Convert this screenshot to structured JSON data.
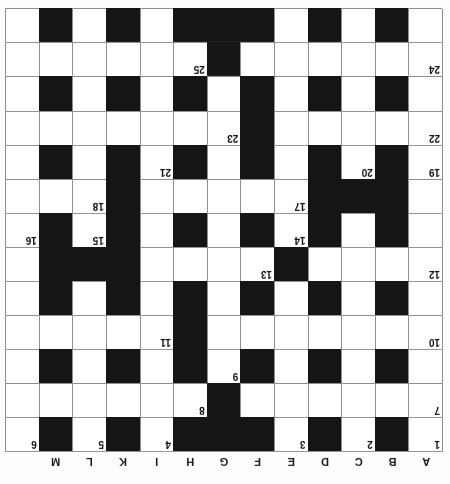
{
  "puzzle": {
    "title": "Crossword Grid",
    "orientation": "upside-down",
    "columns": 13,
    "rows": 13,
    "column_labels": [
      "A",
      "B",
      "C",
      "D",
      "E",
      "F",
      "G",
      "H",
      "I",
      "K",
      "L",
      "M"
    ],
    "numbers_present": [
      1,
      2,
      3,
      4,
      5,
      6,
      7,
      8,
      9,
      10,
      11,
      12,
      13,
      14,
      15,
      16,
      17,
      18,
      19,
      20,
      21,
      22,
      23,
      24,
      25
    ],
    "colors": {
      "block": "#151515",
      "cell": "#ffffff",
      "grid_line": "#8e8e8e",
      "text": "#111111"
    },
    "grid": [
      {
        "cells": [
          {
            "block": false,
            "num": "1"
          },
          {
            "block": true,
            "num": ""
          },
          {
            "block": false,
            "num": "2"
          },
          {
            "block": true,
            "num": ""
          },
          {
            "block": false,
            "num": "3"
          },
          {
            "block": true,
            "num": ""
          },
          {
            "block": true,
            "num": ""
          },
          {
            "block": true,
            "num": ""
          },
          {
            "block": false,
            "num": "4"
          },
          {
            "block": true,
            "num": ""
          },
          {
            "block": false,
            "num": "5"
          },
          {
            "block": true,
            "num": ""
          },
          {
            "block": false,
            "num": "6"
          }
        ]
      },
      {
        "cells": [
          {
            "block": false,
            "num": "7"
          },
          {
            "block": false,
            "num": ""
          },
          {
            "block": false,
            "num": ""
          },
          {
            "block": false,
            "num": ""
          },
          {
            "block": false,
            "num": ""
          },
          {
            "block": false,
            "num": ""
          },
          {
            "block": true,
            "num": ""
          },
          {
            "block": false,
            "num": "8"
          },
          {
            "block": false,
            "num": ""
          },
          {
            "block": false,
            "num": ""
          },
          {
            "block": false,
            "num": ""
          },
          {
            "block": false,
            "num": ""
          },
          {
            "block": false,
            "num": ""
          }
        ]
      },
      {
        "cells": [
          {
            "block": false,
            "num": ""
          },
          {
            "block": true,
            "num": ""
          },
          {
            "block": false,
            "num": ""
          },
          {
            "block": true,
            "num": ""
          },
          {
            "block": false,
            "num": ""
          },
          {
            "block": true,
            "num": ""
          },
          {
            "block": false,
            "num": "9"
          },
          {
            "block": true,
            "num": ""
          },
          {
            "block": false,
            "num": ""
          },
          {
            "block": true,
            "num": ""
          },
          {
            "block": false,
            "num": ""
          },
          {
            "block": true,
            "num": ""
          },
          {
            "block": false,
            "num": ""
          }
        ]
      },
      {
        "cells": [
          {
            "block": false,
            "num": "10"
          },
          {
            "block": false,
            "num": ""
          },
          {
            "block": false,
            "num": ""
          },
          {
            "block": false,
            "num": ""
          },
          {
            "block": false,
            "num": ""
          },
          {
            "block": false,
            "num": ""
          },
          {
            "block": false,
            "num": ""
          },
          {
            "block": true,
            "num": ""
          },
          {
            "block": false,
            "num": "11"
          },
          {
            "block": false,
            "num": ""
          },
          {
            "block": false,
            "num": ""
          },
          {
            "block": false,
            "num": ""
          },
          {
            "block": false,
            "num": ""
          }
        ]
      },
      {
        "cells": [
          {
            "block": false,
            "num": ""
          },
          {
            "block": true,
            "num": ""
          },
          {
            "block": false,
            "num": ""
          },
          {
            "block": true,
            "num": ""
          },
          {
            "block": false,
            "num": ""
          },
          {
            "block": true,
            "num": ""
          },
          {
            "block": false,
            "num": ""
          },
          {
            "block": true,
            "num": ""
          },
          {
            "block": false,
            "num": ""
          },
          {
            "block": true,
            "num": ""
          },
          {
            "block": false,
            "num": ""
          },
          {
            "block": true,
            "num": ""
          },
          {
            "block": false,
            "num": ""
          }
        ]
      },
      {
        "cells": [
          {
            "block": false,
            "num": "12"
          },
          {
            "block": false,
            "num": ""
          },
          {
            "block": false,
            "num": ""
          },
          {
            "block": false,
            "num": ""
          },
          {
            "block": true,
            "num": ""
          },
          {
            "block": false,
            "num": "13"
          },
          {
            "block": false,
            "num": ""
          },
          {
            "block": false,
            "num": ""
          },
          {
            "block": false,
            "num": ""
          },
          {
            "block": true,
            "num": ""
          },
          {
            "block": true,
            "num": ""
          },
          {
            "block": true,
            "num": ""
          },
          {
            "block": false,
            "num": ""
          }
        ]
      },
      {
        "cells": [
          {
            "block": false,
            "num": ""
          },
          {
            "block": true,
            "num": ""
          },
          {
            "block": false,
            "num": ""
          },
          {
            "block": true,
            "num": ""
          },
          {
            "block": false,
            "num": "14"
          },
          {
            "block": true,
            "num": ""
          },
          {
            "block": false,
            "num": ""
          },
          {
            "block": true,
            "num": ""
          },
          {
            "block": false,
            "num": ""
          },
          {
            "block": true,
            "num": ""
          },
          {
            "block": false,
            "num": "15"
          },
          {
            "block": true,
            "num": ""
          },
          {
            "block": false,
            "num": "16"
          }
        ]
      },
      {
        "cells": [
          {
            "block": false,
            "num": ""
          },
          {
            "block": true,
            "num": ""
          },
          {
            "block": true,
            "num": ""
          },
          {
            "block": true,
            "num": ""
          },
          {
            "block": false,
            "num": "17"
          },
          {
            "block": false,
            "num": ""
          },
          {
            "block": false,
            "num": ""
          },
          {
            "block": false,
            "num": ""
          },
          {
            "block": false,
            "num": ""
          },
          {
            "block": true,
            "num": ""
          },
          {
            "block": false,
            "num": "18"
          },
          {
            "block": false,
            "num": ""
          },
          {
            "block": false,
            "num": ""
          }
        ]
      },
      {
        "cells": [
          {
            "block": false,
            "num": "19"
          },
          {
            "block": true,
            "num": ""
          },
          {
            "block": false,
            "num": "20"
          },
          {
            "block": true,
            "num": ""
          },
          {
            "block": false,
            "num": ""
          },
          {
            "block": true,
            "num": ""
          },
          {
            "block": false,
            "num": ""
          },
          {
            "block": true,
            "num": ""
          },
          {
            "block": false,
            "num": "21"
          },
          {
            "block": true,
            "num": ""
          },
          {
            "block": false,
            "num": ""
          },
          {
            "block": true,
            "num": ""
          },
          {
            "block": false,
            "num": ""
          }
        ]
      },
      {
        "cells": [
          {
            "block": false,
            "num": "22"
          },
          {
            "block": false,
            "num": ""
          },
          {
            "block": false,
            "num": ""
          },
          {
            "block": false,
            "num": ""
          },
          {
            "block": false,
            "num": ""
          },
          {
            "block": true,
            "num": ""
          },
          {
            "block": false,
            "num": "23"
          },
          {
            "block": false,
            "num": ""
          },
          {
            "block": false,
            "num": ""
          },
          {
            "block": false,
            "num": ""
          },
          {
            "block": false,
            "num": ""
          },
          {
            "block": false,
            "num": ""
          },
          {
            "block": false,
            "num": ""
          }
        ]
      },
      {
        "cells": [
          {
            "block": false,
            "num": ""
          },
          {
            "block": true,
            "num": ""
          },
          {
            "block": false,
            "num": ""
          },
          {
            "block": true,
            "num": ""
          },
          {
            "block": false,
            "num": ""
          },
          {
            "block": true,
            "num": ""
          },
          {
            "block": false,
            "num": ""
          },
          {
            "block": true,
            "num": ""
          },
          {
            "block": false,
            "num": ""
          },
          {
            "block": true,
            "num": ""
          },
          {
            "block": false,
            "num": ""
          },
          {
            "block": true,
            "num": ""
          },
          {
            "block": false,
            "num": ""
          }
        ]
      },
      {
        "cells": [
          {
            "block": false,
            "num": "24"
          },
          {
            "block": false,
            "num": ""
          },
          {
            "block": false,
            "num": ""
          },
          {
            "block": false,
            "num": ""
          },
          {
            "block": false,
            "num": ""
          },
          {
            "block": false,
            "num": ""
          },
          {
            "block": true,
            "num": ""
          },
          {
            "block": false,
            "num": "25"
          },
          {
            "block": false,
            "num": ""
          },
          {
            "block": false,
            "num": ""
          },
          {
            "block": false,
            "num": ""
          },
          {
            "block": false,
            "num": ""
          },
          {
            "block": false,
            "num": ""
          }
        ]
      },
      {
        "cells": [
          {
            "block": false,
            "num": ""
          },
          {
            "block": true,
            "num": ""
          },
          {
            "block": false,
            "num": ""
          },
          {
            "block": true,
            "num": ""
          },
          {
            "block": false,
            "num": ""
          },
          {
            "block": true,
            "num": ""
          },
          {
            "block": true,
            "num": ""
          },
          {
            "block": true,
            "num": ""
          },
          {
            "block": false,
            "num": ""
          },
          {
            "block": true,
            "num": ""
          },
          {
            "block": false,
            "num": ""
          },
          {
            "block": true,
            "num": ""
          },
          {
            "block": false,
            "num": ""
          }
        ]
      }
    ]
  }
}
